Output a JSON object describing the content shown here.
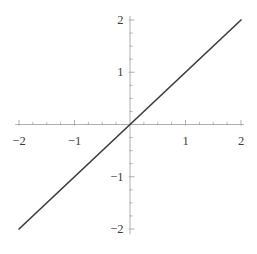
{
  "figure": {
    "background": "#ffffff",
    "title": ""
  },
  "chart_data": {
    "type": "line",
    "title": "",
    "xlabel": "",
    "ylabel": "",
    "xlim": [
      -2.05,
      2.05
    ],
    "ylim": [
      -2.1,
      2.08
    ],
    "axes_through_origin": true,
    "grid": false,
    "legend": null,
    "x_ticks": [
      -2,
      -1,
      1,
      2
    ],
    "x_tick_labels": [
      "−2",
      "−1",
      "1",
      "2"
    ],
    "y_ticks": [
      -2,
      -1,
      1,
      2
    ],
    "y_tick_labels": [
      "−2",
      "−1",
      "1",
      "2"
    ],
    "minor_tick_interval": 0.25,
    "axis_color": "#a6a6a6",
    "tick_color": "#a6a6a6",
    "label_color": "#3c3c3c",
    "series": [
      {
        "name": "y = x",
        "x": [
          -2,
          2
        ],
        "y": [
          -2,
          2
        ],
        "color": "#3f3f3f",
        "width": 1.7
      }
    ]
  }
}
